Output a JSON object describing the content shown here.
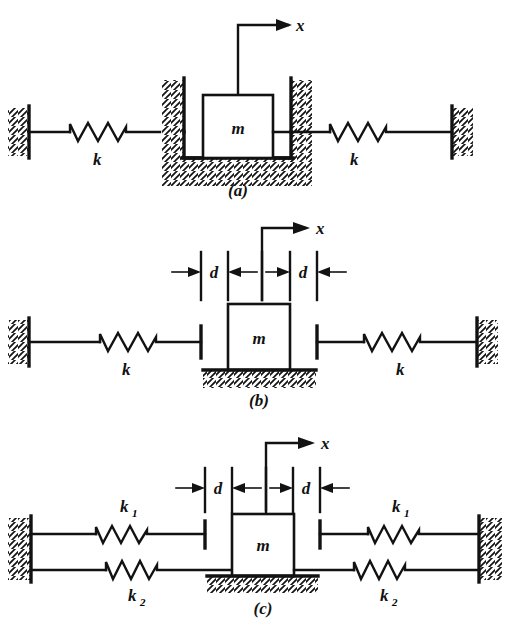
{
  "figure": {
    "type": "engineering-diagram",
    "background_color": "#ffffff",
    "ink_color": "#121212",
    "panel_count": 3
  },
  "panels": [
    {
      "id": "a",
      "caption": "(a)",
      "coordinate_label": "x",
      "mass_label": "m",
      "springs": [
        {
          "position": "left",
          "label": "k"
        },
        {
          "position": "right",
          "label": "k"
        }
      ],
      "gap_labels": [],
      "mass_support": "recessed-pocket-in-hatched-block",
      "description": "Mass m seated in a hatched recess, connected to a fixed wall on each side by a spring of stiffness k. No clearance dimension shown."
    },
    {
      "id": "b",
      "caption": "(b)",
      "coordinate_label": "x",
      "mass_label": "m",
      "springs": [
        {
          "position": "left",
          "label": "k"
        },
        {
          "position": "right",
          "label": "k"
        }
      ],
      "gap_labels": [
        {
          "position": "left",
          "label": "d"
        },
        {
          "position": "right",
          "label": "d"
        }
      ],
      "mass_support": "hatched-ground-line",
      "description": "Mass m resting on hatched ground, with a clearance d on each side before contact with the spring stops of stiffness k."
    },
    {
      "id": "c",
      "caption": "(c)",
      "coordinate_label": "x",
      "mass_label": "m",
      "springs": [
        {
          "position": "upper-left",
          "label": "k",
          "subscript": "1"
        },
        {
          "position": "lower-left",
          "label": "k",
          "subscript": "2"
        },
        {
          "position": "upper-right",
          "label": "k",
          "subscript": "1"
        },
        {
          "position": "lower-right",
          "label": "k",
          "subscript": "2"
        }
      ],
      "gap_labels": [
        {
          "position": "left",
          "label": "d"
        },
        {
          "position": "right",
          "label": "d"
        }
      ],
      "mass_support": "hatched-ground-line",
      "description": "Mass m on hatched ground attached directly to springs k2 on each side, with additional springs k1 engaging only after a clearance d is taken up."
    }
  ]
}
